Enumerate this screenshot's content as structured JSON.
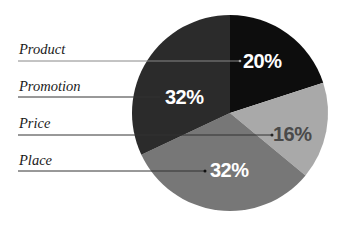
{
  "chart_data": {
    "type": "pie",
    "title": "",
    "categories": [
      "Product",
      "Price",
      "Place",
      "Promotion"
    ],
    "values": [
      20,
      16,
      32,
      32
    ],
    "value_labels": [
      "20%",
      "16%",
      "32%",
      "32%"
    ],
    "colors": [
      "#0d0d0d",
      "#a9a9a9",
      "#777777",
      "#2b2b2b"
    ],
    "label_colors": [
      "#ffffff",
      "#444444",
      "#ffffff",
      "#ffffff"
    ],
    "start_angle_deg": 0,
    "direction": "clockwise",
    "legend": {
      "position": "left",
      "style": "leader-lines",
      "entries": [
        "Product",
        "Promotion",
        "Price",
        "Place"
      ]
    },
    "grid": false
  },
  "labels": {
    "product": {
      "name": "Product",
      "pct": "20%"
    },
    "promotion": {
      "name": "Promotion",
      "pct": "32%"
    },
    "price": {
      "name": "Price",
      "pct": "16%"
    },
    "place": {
      "name": "Place",
      "pct": "32%"
    }
  }
}
